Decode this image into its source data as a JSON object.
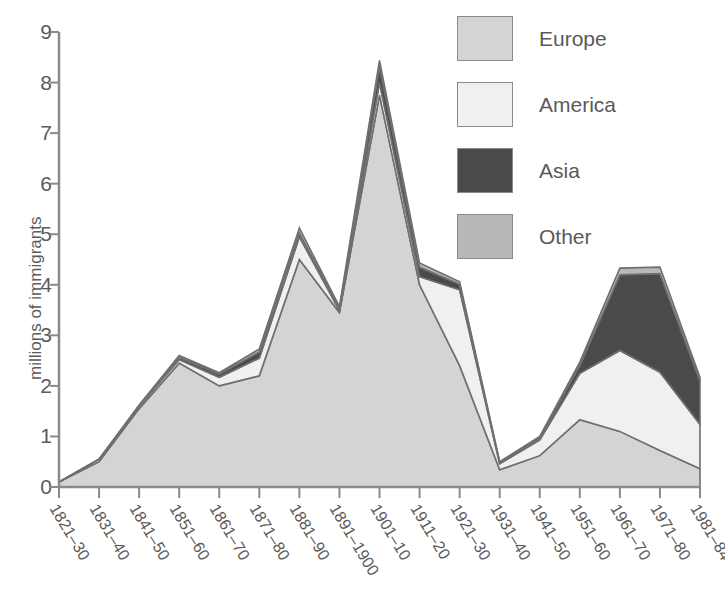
{
  "chart_data": {
    "type": "area",
    "stacked": true,
    "title": "",
    "subtitle": "",
    "xlabel": "",
    "ylabel": "millions of immigrants",
    "ylim": [
      0,
      9
    ],
    "yticks": [
      0,
      1,
      2,
      3,
      4,
      5,
      6,
      7,
      8,
      9
    ],
    "ytick_labels": [
      "0",
      "1",
      "2",
      "3",
      "4",
      "5",
      "6",
      "7",
      "8",
      "9"
    ],
    "grid": false,
    "legend_position": "top-right",
    "categories": [
      "1821–30",
      "1831–40",
      "1841–50",
      "1851–60",
      "1861–70",
      "1871–80",
      "1881–90",
      "1891–1900",
      "1901–10",
      "1911–20",
      "1921–30",
      "1931–40",
      "1941–50",
      "1951–60",
      "1961–70",
      "1971–80",
      "1981–84"
    ],
    "series": [
      {
        "name": "Europe",
        "color": "#d4d4d4",
        "values": [
          0.1,
          0.5,
          1.55,
          2.45,
          2.0,
          2.2,
          4.5,
          3.45,
          7.75,
          4.0,
          2.4,
          0.34,
          0.62,
          1.33,
          1.1,
          0.72,
          0.36
        ]
      },
      {
        "name": "America",
        "color": "#f0f0f0",
        "values": [
          0.0,
          0.05,
          0.05,
          0.07,
          0.17,
          0.35,
          0.45,
          0.04,
          0.25,
          0.16,
          1.5,
          0.12,
          0.31,
          0.92,
          1.6,
          1.55,
          0.88
        ]
      },
      {
        "name": "Asia",
        "color": "#4a4a4a",
        "values": [
          0.0,
          0.0,
          0.0,
          0.04,
          0.06,
          0.12,
          0.07,
          0.04,
          0.32,
          0.19,
          0.11,
          0.02,
          0.04,
          0.15,
          1.5,
          1.95,
          0.85
        ]
      },
      {
        "name": "Other",
        "color": "#b8b8b8",
        "values": [
          0.0,
          0.0,
          0.02,
          0.04,
          0.03,
          0.06,
          0.1,
          0.04,
          0.12,
          0.08,
          0.05,
          0.02,
          0.03,
          0.07,
          0.13,
          0.13,
          0.08
        ]
      }
    ],
    "totals": [
      0.1,
      0.55,
      1.62,
      2.6,
      2.26,
      2.73,
      5.12,
      3.57,
      8.44,
      4.43,
      4.06,
      0.5,
      1.0,
      2.47,
      4.33,
      4.35,
      2.17
    ]
  },
  "legend": {
    "items": [
      {
        "label": "Europe",
        "color": "#d4d4d4"
      },
      {
        "label": "America",
        "color": "#f0f0f0"
      },
      {
        "label": "Asia",
        "color": "#4a4a4a"
      },
      {
        "label": "Other",
        "color": "#b8b8b8"
      }
    ]
  },
  "axes": {
    "y_title": "millions of immigrants",
    "axis_color": "#8a8a8a",
    "text_color": "#5a5a5a"
  }
}
